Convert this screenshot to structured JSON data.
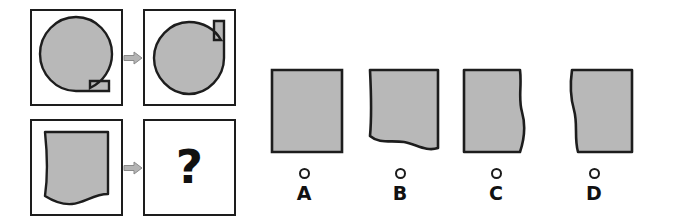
{
  "puzzle": {
    "type": "visual-analogy-rotation",
    "question_symbol": "?",
    "arrow_symbol": "right-arrow",
    "colors": {
      "shape_fill": "#b8b8b8",
      "shape_stroke": "#1d1d1d",
      "cell_border": "#1d1d1d",
      "arrow_fill": "#b4b4b4",
      "arrow_stroke": "#7d7d7d",
      "text": "#111111",
      "background": "#ffffff"
    },
    "matrix": {
      "rows": [
        {
          "name": "example-row",
          "source": {
            "shape_name": "circle-with-bottom-right-tab",
            "description": "Filled circle with rectangular tab extending to the lower right"
          },
          "target": {
            "shape_name": "circle-with-top-right-tab",
            "description": "Same circle rotated so the rectangular tab points up at the upper right"
          }
        },
        {
          "name": "question-row",
          "source": {
            "shape_name": "square-with-wavy-bottom",
            "description": "Filled square whose bottom edge is a wave and left edge slightly curved"
          },
          "target": {
            "shape_name": "unknown",
            "description": "Unknown answer, shown as a question mark"
          }
        }
      ]
    },
    "options": [
      {
        "label": "A",
        "shape_name": "plain-square",
        "description": "Plain filled square with straight edges",
        "selected": false
      },
      {
        "label": "B",
        "shape_name": "square-with-wavy-bottom",
        "description": "Filled square with a wavy bottom edge",
        "selected": false
      },
      {
        "label": "C",
        "shape_name": "square-with-wavy-right",
        "description": "Filled square with a wavy right edge",
        "selected": false
      },
      {
        "label": "D",
        "shape_name": "square-with-wavy-left",
        "description": "Filled square with a wavy left edge",
        "selected": false
      }
    ]
  }
}
